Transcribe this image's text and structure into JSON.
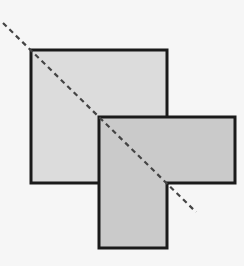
{
  "diagram": {
    "colors": {
      "background": "#f6f6f6",
      "square_fill": "#dcdcdc",
      "l_shape_fill": "#cacaca",
      "outline": "#1a1a1a",
      "dashed_line": "#444444"
    },
    "shapes": [
      {
        "id": "square",
        "kind": "square"
      },
      {
        "id": "l-shape",
        "kind": "L-polygon"
      },
      {
        "id": "diagonal",
        "kind": "dashed-line"
      }
    ]
  }
}
